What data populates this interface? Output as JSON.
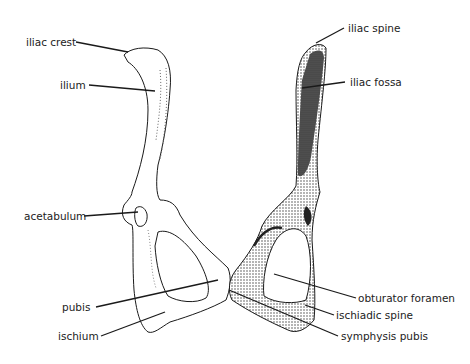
{
  "diagram": {
    "labels": {
      "iliac_crest": "iliac crest",
      "ilium": "ilium",
      "acetabulum": "acetabulum",
      "pubis": "pubis",
      "ischium": "ischium",
      "iliac_spine": "iliac spine",
      "iliac_fossa": "iliac fossa",
      "obturator_foramen": "obturator foramen",
      "ischiadic_spine": "ischiadic spine",
      "symphysis_pubis": "symphysis pubis"
    },
    "colors": {
      "ink": "#1a1a1a",
      "background": "#ffffff",
      "shading": "#444444"
    }
  }
}
